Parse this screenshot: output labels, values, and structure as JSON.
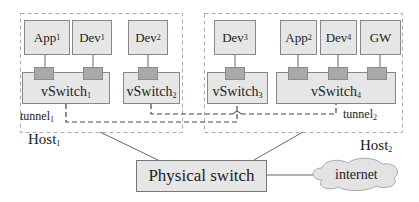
{
  "diagram": {
    "hosts": [
      {
        "name": "Host",
        "sub": "1"
      },
      {
        "name": "Host",
        "sub": "2"
      }
    ],
    "host1_nodes": [
      {
        "name": "App",
        "sub": "1"
      },
      {
        "name": "Dev",
        "sub": "1"
      },
      {
        "name": "Dev",
        "sub": "2"
      }
    ],
    "host2_nodes": [
      {
        "name": "Dev",
        "sub": "3"
      },
      {
        "name": "App",
        "sub": "2"
      },
      {
        "name": "Dev",
        "sub": "4"
      },
      {
        "name": "GW",
        "sub": ""
      }
    ],
    "vswitches": [
      {
        "name": "vSwitch",
        "sub": "1"
      },
      {
        "name": "vSwitch",
        "sub": "2"
      },
      {
        "name": "vSwitch",
        "sub": "3"
      },
      {
        "name": "vSwitch",
        "sub": "4"
      }
    ],
    "tunnels": [
      {
        "name": "tunnel",
        "sub": "1"
      },
      {
        "name": "tunnel",
        "sub": "2"
      }
    ],
    "physical_switch": "Physical switch",
    "internet": "internet",
    "colors": {
      "node_fill": "#e6e6e6",
      "port_fill": "#a9a9a9",
      "border": "#888888",
      "dashed": "#aaaaaa",
      "tunnel_line": "#444444"
    }
  }
}
